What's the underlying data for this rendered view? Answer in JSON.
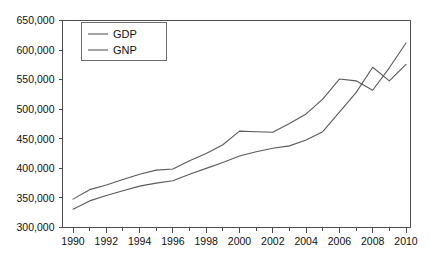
{
  "chart_data": {
    "type": "line",
    "title": "",
    "subtitle": "",
    "xlabel": "",
    "ylabel": "",
    "grid": false,
    "legend_position": "top-left",
    "xlim": [
      1990,
      2010
    ],
    "ylim": [
      300000,
      650000
    ],
    "x": [
      1990,
      1991,
      1992,
      1993,
      1994,
      1995,
      1996,
      1997,
      1998,
      1999,
      2000,
      2001,
      2002,
      2003,
      2004,
      2005,
      2006,
      2007,
      2008,
      2009,
      2010
    ],
    "x_tick_labels": [
      "1990",
      "1992",
      "1994",
      "1996",
      "1998",
      "2000",
      "2002",
      "2004",
      "2006",
      "2008",
      "2010"
    ],
    "x_tick_values": [
      1990,
      1992,
      1994,
      1996,
      1998,
      2000,
      2002,
      2004,
      2006,
      2008,
      2010
    ],
    "x_minor_tick_values": [
      1991,
      1993,
      1995,
      1997,
      1999,
      2001,
      2003,
      2005,
      2007,
      2009
    ],
    "y_tick_labels": [
      "300,000",
      "350,000",
      "400,000",
      "450,000",
      "500,000",
      "550,000",
      "600,000",
      "650,000"
    ],
    "y_tick_values": [
      300000,
      350000,
      400000,
      450000,
      500000,
      550000,
      600000,
      650000
    ],
    "series": [
      {
        "name": "GDP",
        "values": [
          348000,
          364000,
          372000,
          381000,
          390000,
          397000,
          399000,
          413000,
          425000,
          440000,
          463000,
          462000,
          461000,
          476000,
          492000,
          517000,
          551000,
          548000,
          532000,
          570000,
          612000
        ]
      },
      {
        "name": "GNP",
        "values": [
          331000,
          345000,
          354000,
          362000,
          370000,
          375000,
          379000,
          390000,
          400000,
          410000,
          421000,
          428000,
          434000,
          438000,
          448000,
          462000,
          495000,
          528000,
          571000,
          548000,
          576000
        ]
      }
    ],
    "legend_entries": [
      "GDP",
      "GNP"
    ],
    "colors": {
      "gdp_line": "#5a5a5a",
      "gnp_line": "#5a5a5a",
      "axis": "#4c4c4c",
      "text": "#111111",
      "background": "#ffffff"
    }
  },
  "legend": {
    "items": [
      {
        "label": "GDP"
      },
      {
        "label": "GNP"
      }
    ]
  }
}
